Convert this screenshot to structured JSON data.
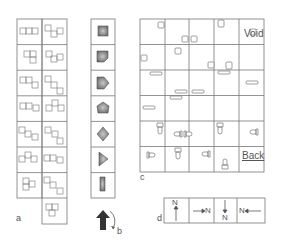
{
  "figure": {
    "panel_labels": {
      "a": "a",
      "b": "b",
      "c": "c",
      "d": "d"
    },
    "panel_a": {
      "description": "Tetromino/polyomino pair shapes, 2 columns",
      "rows_col1": 7,
      "rows_col2": 8
    },
    "panel_b": {
      "description": "Item shapes in gray, with rotation arrow",
      "items": [
        "square",
        "notched-square",
        "pentagon-right",
        "pentagon-tilted",
        "diamond",
        "triangle-right",
        "bar"
      ],
      "arrow": "up-arrow-with-rotation"
    },
    "panel_c": {
      "description": "5x6 grid with scattered object glyphs",
      "cols": 5,
      "rows": 6,
      "text_void": "Void",
      "text_back": "Back"
    },
    "panel_d": {
      "description": "Orientation indicators",
      "cells": [
        {
          "dir": "up",
          "text": "N"
        },
        {
          "dir": "right",
          "text": "N"
        },
        {
          "dir": "down",
          "text": "N"
        },
        {
          "dir": "left",
          "text": "N"
        }
      ]
    }
  }
}
